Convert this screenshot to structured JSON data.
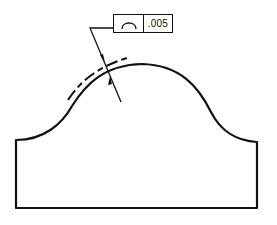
{
  "drawing": {
    "title": "Profile of a line tolerance",
    "feature_control_frame": {
      "symbol": "profile-of-a-line",
      "tolerance": ".005"
    },
    "colors": {
      "line": "#111111",
      "background": "#ffffff"
    }
  }
}
